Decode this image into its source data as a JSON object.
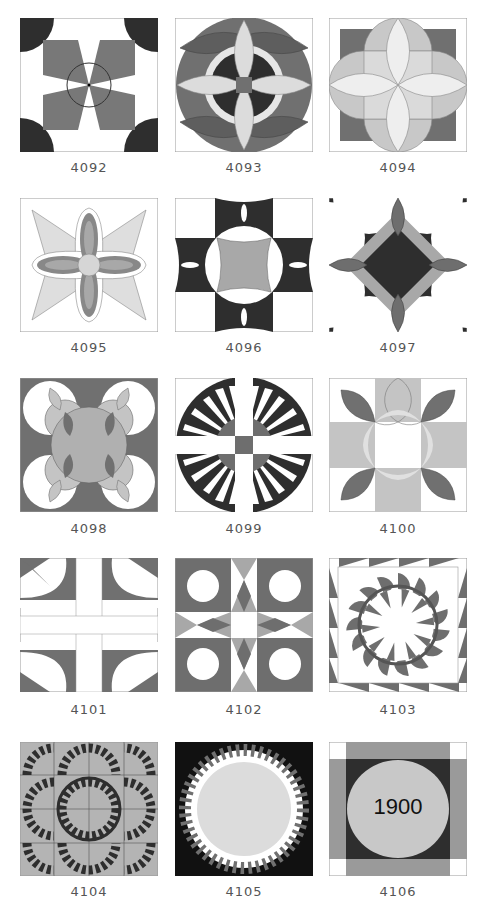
{
  "page": {
    "type": "quilt-block-catalog",
    "columns": 3,
    "rows": 5
  },
  "colors": {
    "dark": "#2e2e2e",
    "medium": "#707070",
    "mediumLight": "#9a9a9a",
    "light": "#c4c4c4",
    "pale": "#e0e0e0",
    "white": "#ffffff",
    "outline": "#999999"
  },
  "blocks": [
    {
      "id": "4092",
      "label": "4092"
    },
    {
      "id": "4093",
      "label": "4093"
    },
    {
      "id": "4094",
      "label": "4094"
    },
    {
      "id": "4095",
      "label": "4095"
    },
    {
      "id": "4096",
      "label": "4096"
    },
    {
      "id": "4097",
      "label": "4097"
    },
    {
      "id": "4098",
      "label": "4098"
    },
    {
      "id": "4099",
      "label": "4099"
    },
    {
      "id": "4100",
      "label": "4100"
    },
    {
      "id": "4101",
      "label": "4101"
    },
    {
      "id": "4102",
      "label": "4102"
    },
    {
      "id": "4103",
      "label": "4103"
    },
    {
      "id": "4104",
      "label": "4104"
    },
    {
      "id": "4105",
      "label": "4105"
    },
    {
      "id": "4106",
      "label": "4106",
      "center_text": "1900"
    }
  ]
}
